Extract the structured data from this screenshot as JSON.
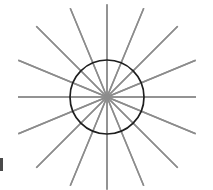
{
  "figure": {
    "type": "geometric-line-diagram",
    "canvas": {
      "width": 213,
      "height": 190,
      "background_color": "#ffffff"
    },
    "center": {
      "x": 107,
      "y": 97
    },
    "circle": {
      "name": "inner-circle",
      "radius": 37,
      "stroke_color": "#1e1e1e",
      "stroke_width": 1.7,
      "fill": "none",
      "left_edge_x": 70,
      "right_edge_x": 144,
      "top_edge_y": 60,
      "bottom_edge_y": 134
    },
    "spokes": {
      "name": "radial-spokes",
      "count": 16,
      "angle_step_degrees": 22.5,
      "stroke_color": "#8c8c8c",
      "stroke_width": 1.5,
      "length_outer": 100,
      "description": "Sixteen straight gray lines radiating from the center, spaced every 22.5 degrees, extending beyond the circle to the image edges",
      "angles_degrees": [
        0,
        22.5,
        45,
        67.5,
        90,
        112.5,
        135,
        157.5,
        180,
        202.5,
        225,
        247.5,
        270,
        292.5,
        315,
        337.5
      ],
      "endpoint_lengths": [
        89,
        96,
        100,
        96,
        92,
        96,
        100,
        96,
        89,
        96,
        100,
        96,
        93,
        96,
        100,
        96
      ]
    },
    "edge_mark": {
      "name": "left-edge-mark",
      "color": "#4a4a4a",
      "x": 0,
      "y": 158,
      "width": 3,
      "height": 13
    }
  },
  "chart_data": {
    "type": "scatter",
    "xlabel": "",
    "ylabel": "",
    "xlim": [
      0,
      213
    ],
    "ylim": [
      0,
      190
    ],
    "grid": false,
    "legend": "none",
    "center": [
      107,
      97
    ],
    "circle_radius": 37,
    "spoke_count": 16,
    "angle_step_degrees": 22.5,
    "x": [
      0,
      22.5,
      45,
      67.5,
      90,
      112.5,
      135,
      157.5,
      180,
      202.5,
      225,
      247.5,
      270,
      292.5,
      315,
      337.5
    ],
    "values": [
      89,
      96,
      100,
      96,
      92,
      96,
      100,
      96,
      89,
      96,
      100,
      96,
      93,
      96,
      100,
      96
    ],
    "series": [
      {
        "name": "spoke-radius",
        "values": [
          89,
          96,
          100,
          96,
          92,
          96,
          100,
          96,
          89,
          96,
          100,
          96,
          93,
          96,
          100,
          96
        ]
      },
      {
        "name": "circle-radius",
        "values": [
          37,
          37,
          37,
          37,
          37,
          37,
          37,
          37,
          37,
          37,
          37,
          37,
          37,
          37,
          37,
          37
        ]
      }
    ],
    "categories": [
      "0°",
      "22.5°",
      "45°",
      "67.5°",
      "90°",
      "112.5°",
      "135°",
      "157.5°",
      "180°",
      "202.5°",
      "225°",
      "247.5°",
      "270°",
      "292.5°",
      "315°",
      "337.5°"
    ],
    "colors": {
      "spoke": "#8c8c8c",
      "circle": "#1e1e1e",
      "background": "#ffffff",
      "edge_mark": "#4a4a4a"
    }
  }
}
